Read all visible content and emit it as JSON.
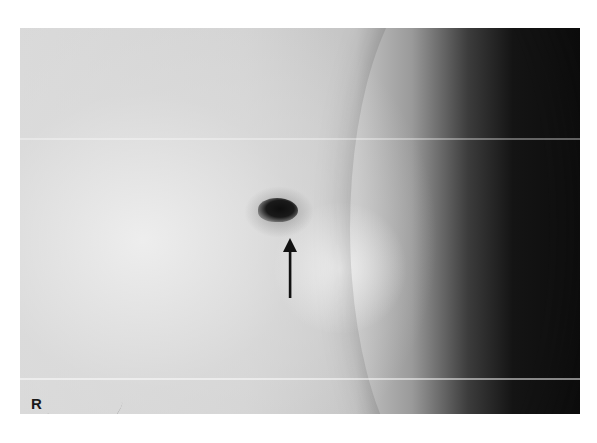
{
  "image": {
    "description": "Radiographic (mammogram-style) film showing a small dark dense lesion indicated by an arrow",
    "laterality_marker": "R",
    "annotation": {
      "type": "arrow",
      "direction": "up",
      "points_to": "lesion",
      "color": "#111111"
    },
    "colors": {
      "background": "#ffffff",
      "tissue_light": "#d6d6d6",
      "tissue_dark": "#0c0c0c",
      "lesion": "#111111"
    }
  }
}
